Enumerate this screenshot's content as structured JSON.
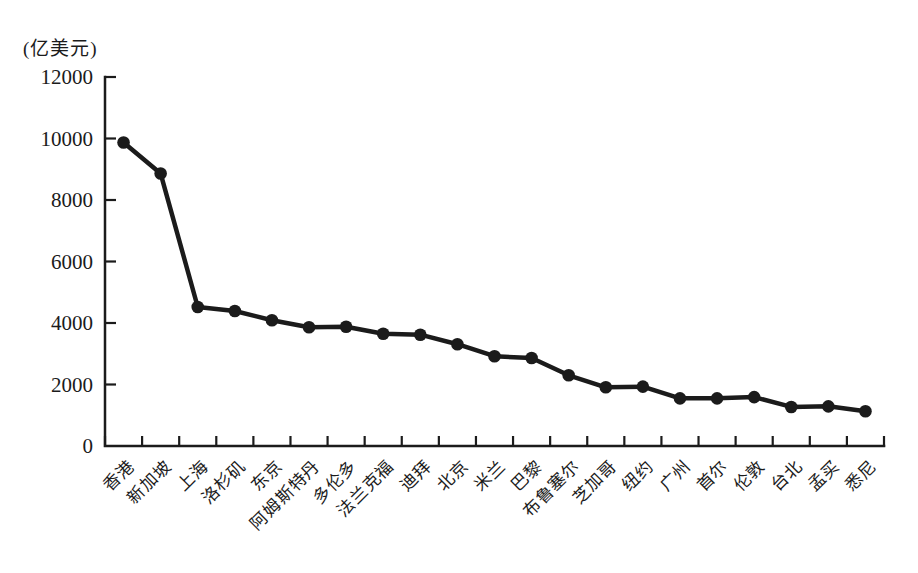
{
  "chart_data": {
    "type": "line",
    "title": "",
    "xlabel": "",
    "ylabel": "(亿美元)",
    "unit_label": "(亿美元)",
    "categories": [
      "香港",
      "新加坡",
      "上海",
      "洛杉矶",
      "东京",
      "阿姆斯特丹",
      "多伦多",
      "法兰克福",
      "迪拜",
      "北京",
      "米兰",
      "巴黎",
      "布鲁塞尔",
      "芝加哥",
      "纽约",
      "广州",
      "首尔",
      "伦敦",
      "台北",
      "孟买",
      "悉尼"
    ],
    "values": [
      9870,
      8860,
      4520,
      4390,
      4090,
      3860,
      3880,
      3650,
      3620,
      3310,
      2920,
      2860,
      2300,
      1910,
      1930,
      1550,
      1550,
      1590,
      1270,
      1290,
      1130
    ],
    "ylim": [
      0,
      12000
    ],
    "yticks": [
      0,
      2000,
      4000,
      6000,
      8000,
      10000,
      12000
    ],
    "grid": false,
    "legend_position": "none",
    "line_color": "#1b1b1b",
    "marker": "filled-circle",
    "background_color": "#ffffff",
    "x_label_rotation_deg": -45
  }
}
